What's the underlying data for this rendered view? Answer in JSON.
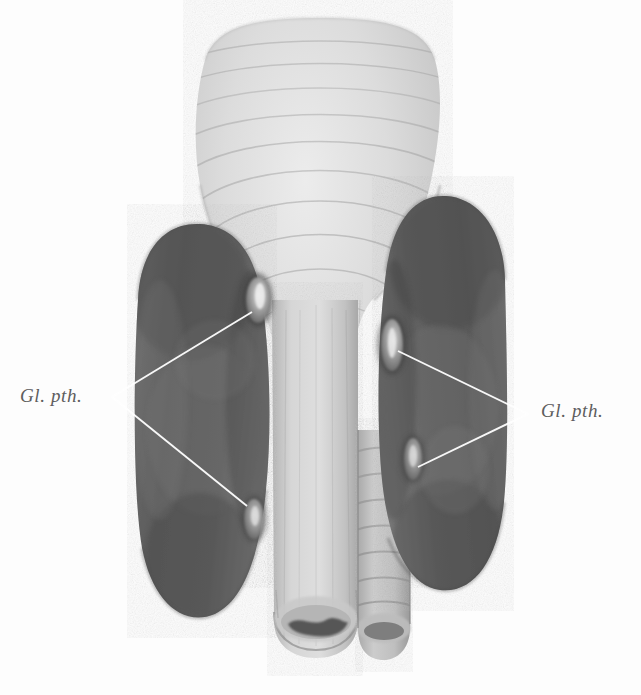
{
  "figure": {
    "type": "anatomical-illustration",
    "background_color": "#fdfdfd",
    "width": 641,
    "height": 695
  },
  "labels": [
    {
      "id": "left",
      "text": "Gl. pth.",
      "color": "#5e5e5e",
      "x": 20,
      "y": 386,
      "leader_apex": {
        "x": 112,
        "y": 397
      },
      "leader_targets": [
        {
          "x": 252,
          "y": 312
        },
        {
          "x": 247,
          "y": 506
        }
      ]
    },
    {
      "id": "right",
      "text": "Gl. pth.",
      "color": "#5e5e5e",
      "x": 541,
      "y": 401,
      "leader_apex": {
        "x": 528,
        "y": 414
      },
      "leader_targets": [
        {
          "x": 398,
          "y": 351
        },
        {
          "x": 418,
          "y": 467
        }
      ]
    }
  ],
  "structures": {
    "larynx_pharynx": {
      "name": "pharynx-larynx",
      "fill": "#d8d8d8"
    },
    "left_lobe": {
      "name": "thyroid-lobe-left",
      "fill": "#646464"
    },
    "right_lobe": {
      "name": "thyroid-lobe-right",
      "fill": "#646464"
    },
    "esophagus": {
      "name": "esophagus",
      "fill": "#cfcfcf"
    },
    "trachea": {
      "name": "trachea",
      "fill": "#c4c4c4"
    },
    "parathyroids": [
      {
        "name": "parathyroid-upper-left",
        "cx": 258,
        "cy": 300,
        "rx": 13,
        "ry": 24
      },
      {
        "name": "parathyroid-lower-left",
        "cx": 254,
        "cy": 519,
        "rx": 11,
        "ry": 21
      },
      {
        "name": "parathyroid-upper-right",
        "cx": 392,
        "cy": 345,
        "rx": 13,
        "ry": 27
      },
      {
        "name": "parathyroid-lower-right",
        "cx": 413,
        "cy": 459,
        "rx": 11,
        "ry": 22
      }
    ]
  },
  "leader_line_color": "#ffffff"
}
